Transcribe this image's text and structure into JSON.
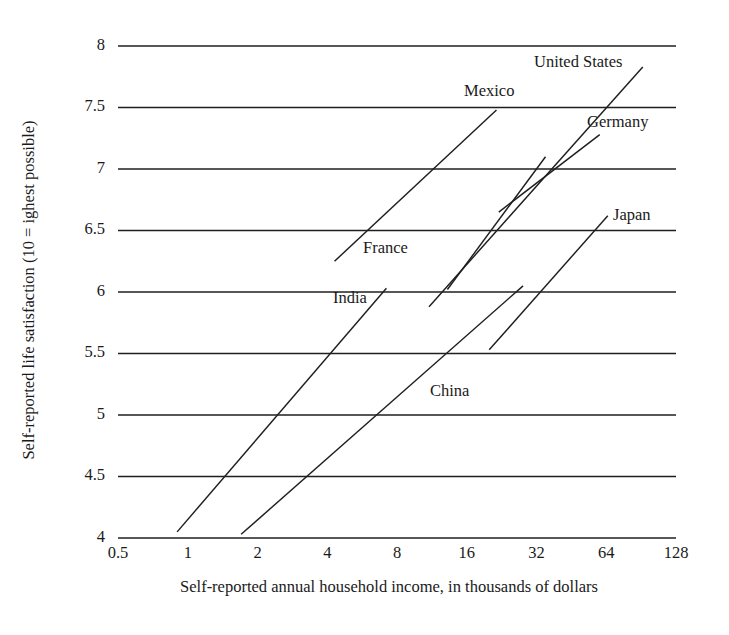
{
  "chart_data": {
    "type": "line",
    "title": "",
    "subtitle": "",
    "xlabel": "Self-reported annual household income, in thousands of dollars",
    "ylabel": "Self-reported life satisfaction (10 = ighest possible)",
    "x_scale": "log2",
    "xlim": [
      0.5,
      128
    ],
    "ylim": [
      4,
      8
    ],
    "grid": "horizontal",
    "legend": "inline-labels",
    "x_ticks": [
      "0.5",
      "1",
      "2",
      "4",
      "8",
      "16",
      "32",
      "64",
      "128"
    ],
    "x_tick_values": [
      0.5,
      1,
      2,
      4,
      8,
      16,
      32,
      64,
      128
    ],
    "y_ticks": [
      "8",
      "7.5",
      "7",
      "6.5",
      "6",
      "5.5",
      "5",
      "4.5",
      "4"
    ],
    "y_tick_values": [
      8,
      7.5,
      7,
      6.5,
      6,
      5.5,
      5,
      4.5,
      4
    ],
    "series": [
      {
        "name": "United States",
        "label": "United States",
        "x": [
          11.0,
          92.0
        ],
        "y": [
          5.88,
          7.83
        ],
        "label_pos": {
          "x": 534,
          "y": 67
        }
      },
      {
        "name": "Mexico",
        "label": "Mexico",
        "x": [
          4.3,
          21.5
        ],
        "y": [
          6.25,
          7.48
        ],
        "label_pos": {
          "x": 464,
          "y": 96
        }
      },
      {
        "name": "Germany",
        "label": "Germany",
        "x": [
          22.0,
          60.0
        ],
        "y": [
          6.65,
          7.28
        ],
        "label_pos": {
          "x": 587,
          "y": 127
        }
      },
      {
        "name": "Japan",
        "label": "Japan",
        "x": [
          20.0,
          65.0
        ],
        "y": [
          5.53,
          6.62
        ],
        "label_pos": {
          "x": 613,
          "y": 220
        }
      },
      {
        "name": "France",
        "label": "France",
        "x": [
          13.2,
          35.0
        ],
        "y": [
          6.02,
          7.1
        ],
        "label_pos": {
          "x": 363,
          "y": 253
        }
      },
      {
        "name": "India",
        "label": "India",
        "x": [
          0.9,
          7.2
        ],
        "y": [
          4.05,
          6.03
        ],
        "label_pos": {
          "x": 333,
          "y": 303
        }
      },
      {
        "name": "China",
        "label": "China",
        "x": [
          1.7,
          28.0
        ],
        "y": [
          4.03,
          6.05
        ],
        "label_pos": {
          "x": 430,
          "y": 396
        }
      }
    ]
  },
  "axes": {
    "y_title": "Self-reported life satisfaction (10 = ighest possible)",
    "x_title": "Self-reported annual household income, in thousands of dollars"
  },
  "colors": {
    "ink": "#1f1f1f",
    "background": "#ffffff"
  }
}
